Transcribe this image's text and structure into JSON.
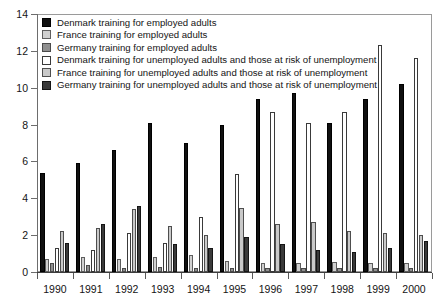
{
  "chart_data": {
    "type": "bar",
    "title": "",
    "subtitle": "",
    "xlabel": "",
    "ylabel": "",
    "ylim": [
      0,
      14
    ],
    "y_ticks": [
      0,
      2,
      4,
      6,
      8,
      10,
      12,
      14
    ],
    "grid": false,
    "legend_position": "top-left",
    "categories": [
      "1990",
      "1991",
      "1992",
      "1993",
      "1994",
      "1995",
      "1996",
      "1997",
      "1998",
      "1999",
      "2000"
    ],
    "series": [
      {
        "name": "Denmark training for employed adults",
        "key": "denmark-employed",
        "color": "#101010",
        "values": [
          5.4,
          5.9,
          6.6,
          8.1,
          7.0,
          8.0,
          9.4,
          9.7,
          8.1,
          9.4,
          10.2
        ]
      },
      {
        "name": "France training for employed adults",
        "key": "france-employed",
        "color": "#d0d0d0",
        "values": [
          0.7,
          0.8,
          0.7,
          0.8,
          0.9,
          0.6,
          0.5,
          0.5,
          0.55,
          0.5,
          0.5
        ]
      },
      {
        "name": "Germany training for employed adults",
        "key": "germany-employed",
        "color": "#8f8f8f",
        "values": [
          0.5,
          0.4,
          0.2,
          0.25,
          0.2,
          0.2,
          0.2,
          0.2,
          0.2,
          0.2,
          0.2
        ]
      },
      {
        "name": "Denmark training for unemployed adults and those at risk of unemployment",
        "key": "denmark-unemployed",
        "color": "#ffffff",
        "values": [
          1.3,
          1.2,
          2.1,
          1.6,
          3.0,
          5.3,
          8.7,
          8.1,
          8.7,
          12.3,
          11.6
        ]
      },
      {
        "name": "France training for unemployed adults and those at risk of unemployment",
        "key": "france-unemployed",
        "color": "#c9c9c9",
        "values": [
          2.2,
          2.4,
          3.4,
          2.5,
          2.0,
          3.5,
          2.6,
          2.7,
          2.2,
          2.1,
          2.0
        ]
      },
      {
        "name": "Germany training for unemployed adults and those at risk of unemployment",
        "key": "germany-unemployed",
        "color": "#3a3a3a",
        "values": [
          1.6,
          2.6,
          3.6,
          1.5,
          1.3,
          1.9,
          1.5,
          1.2,
          1.1,
          1.3,
          1.7
        ]
      }
    ]
  }
}
